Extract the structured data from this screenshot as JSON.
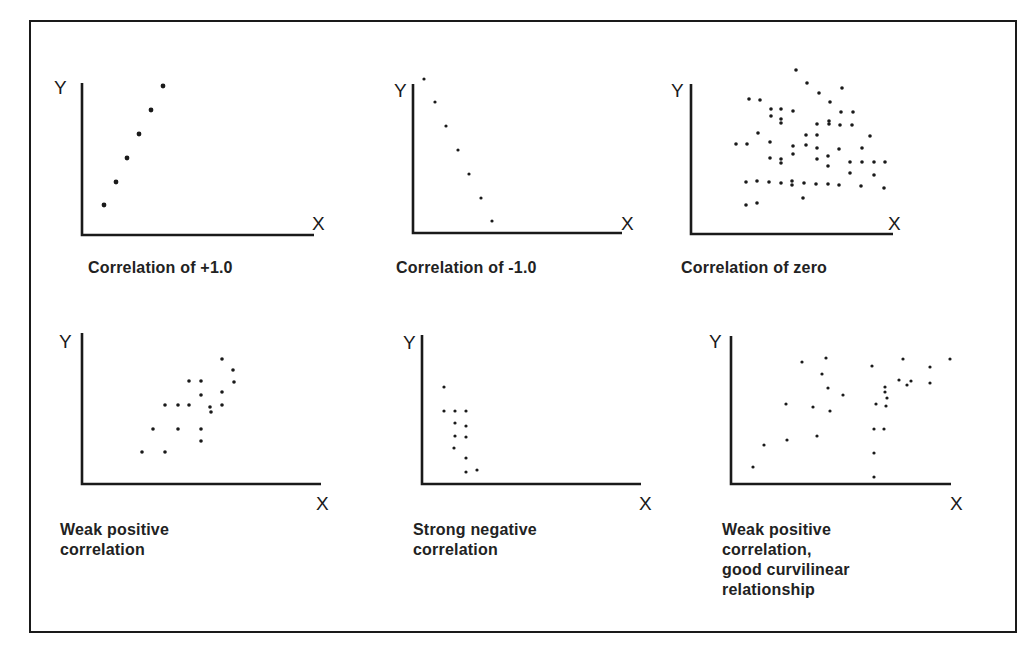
{
  "figure": {
    "border_color": "#1a1a1a",
    "ink_color": "#1a1a1a"
  },
  "chart_data": [
    {
      "type": "scatter",
      "title": "Correlation of +1.0",
      "xlabel": "X",
      "ylabel": "Y",
      "grid": false,
      "axes": {
        "origin": [
          82,
          235
        ],
        "y_top": 83,
        "x_end": 314
      },
      "label_pos": {
        "y": [
          54,
          78
        ],
        "x": [
          312,
          214
        ],
        "caption": [
          88,
          258
        ]
      },
      "points": [
        [
          104,
          205
        ],
        [
          116,
          182
        ],
        [
          127,
          158
        ],
        [
          139,
          134
        ],
        [
          151,
          110
        ],
        [
          163,
          86
        ]
      ]
    },
    {
      "type": "scatter",
      "title": "Correlation of -1.0",
      "xlabel": "X",
      "ylabel": "Y",
      "grid": false,
      "axes": {
        "origin": [
          413,
          233
        ],
        "y_top": 84,
        "x_end": 622
      },
      "label_pos": {
        "y": [
          394,
          81
        ],
        "x": [
          621,
          214
        ],
        "caption": [
          396,
          258
        ]
      },
      "points": [
        [
          424,
          79
        ],
        [
          435,
          102
        ],
        [
          446,
          126
        ],
        [
          458,
          150
        ],
        [
          469,
          174
        ],
        [
          481,
          198
        ],
        [
          492,
          221
        ]
      ]
    },
    {
      "type": "scatter",
      "title": "Correlation of zero",
      "xlabel": "X",
      "ylabel": "Y",
      "grid": false,
      "axes": {
        "origin": [
          691,
          234
        ],
        "y_top": 84,
        "x_end": 893
      },
      "label_pos": {
        "y": [
          671,
          81
        ],
        "x": [
          888,
          214
        ],
        "caption": [
          681,
          258
        ]
      },
      "points": [
        [
          796,
          70
        ],
        [
          807,
          83
        ],
        [
          819,
          93
        ],
        [
          842,
          88
        ],
        [
          830,
          102
        ],
        [
          749,
          99
        ],
        [
          760,
          100
        ],
        [
          771,
          109
        ],
        [
          781,
          109
        ],
        [
          771,
          116
        ],
        [
          793,
          111
        ],
        [
          781,
          123
        ],
        [
          781,
          119
        ],
        [
          841,
          112
        ],
        [
          853,
          112
        ],
        [
          817,
          124
        ],
        [
          829,
          121
        ],
        [
          829,
          124
        ],
        [
          840,
          125
        ],
        [
          852,
          125
        ],
        [
          758,
          133
        ],
        [
          870,
          136
        ],
        [
          806,
          135
        ],
        [
          817,
          135
        ],
        [
          736,
          144
        ],
        [
          747,
          144
        ],
        [
          770,
          142
        ],
        [
          793,
          146
        ],
        [
          806,
          145
        ],
        [
          817,
          148
        ],
        [
          839,
          149
        ],
        [
          862,
          148
        ],
        [
          793,
          154
        ],
        [
          817,
          159
        ],
        [
          828,
          156
        ],
        [
          770,
          158
        ],
        [
          781,
          159
        ],
        [
          781,
          163
        ],
        [
          828,
          166
        ],
        [
          850,
          162
        ],
        [
          862,
          162
        ],
        [
          874,
          162
        ],
        [
          885,
          162
        ],
        [
          850,
          173
        ],
        [
          874,
          175
        ],
        [
          746,
          182
        ],
        [
          757,
          181
        ],
        [
          769,
          182
        ],
        [
          781,
          183
        ],
        [
          792,
          181
        ],
        [
          792,
          185
        ],
        [
          804,
          183
        ],
        [
          816,
          184
        ],
        [
          828,
          184
        ],
        [
          839,
          185
        ],
        [
          861,
          186
        ],
        [
          884,
          188
        ],
        [
          803,
          198
        ],
        [
          746,
          205
        ],
        [
          757,
          203
        ]
      ]
    },
    {
      "type": "scatter",
      "title": "Weak positive\ncorrelation",
      "xlabel": "X",
      "ylabel": "Y",
      "grid": false,
      "axes": {
        "origin": [
          82,
          484
        ],
        "y_top": 333,
        "x_end": 321
      },
      "label_pos": {
        "y": [
          59,
          332
        ],
        "x": [
          316,
          494
        ],
        "caption": [
          60,
          520
        ]
      },
      "points": [
        [
          142,
          452
        ],
        [
          165,
          452
        ],
        [
          153,
          429
        ],
        [
          178,
          429
        ],
        [
          201,
          429
        ],
        [
          201,
          441
        ],
        [
          165,
          405
        ],
        [
          178,
          405
        ],
        [
          189,
          405
        ],
        [
          201,
          395
        ],
        [
          210,
          407
        ],
        [
          211,
          412
        ],
        [
          222,
          392
        ],
        [
          222,
          405
        ],
        [
          189,
          381
        ],
        [
          201,
          381
        ],
        [
          222,
          359
        ],
        [
          233,
          370
        ],
        [
          234,
          382
        ]
      ]
    },
    {
      "type": "scatter",
      "title": "Strong negative\ncorrelation",
      "xlabel": "X",
      "ylabel": "Y",
      "grid": false,
      "axes": {
        "origin": [
          422,
          484
        ],
        "y_top": 335,
        "x_end": 641
      },
      "label_pos": {
        "y": [
          403,
          333
        ],
        "x": [
          639,
          494
        ],
        "caption": [
          413,
          520
        ]
      },
      "points": [
        [
          444,
          387
        ],
        [
          444,
          411
        ],
        [
          455,
          411
        ],
        [
          466,
          411
        ],
        [
          455,
          423
        ],
        [
          466,
          426
        ],
        [
          455,
          436
        ],
        [
          466,
          437
        ],
        [
          454,
          448
        ],
        [
          466,
          458
        ],
        [
          466,
          472
        ],
        [
          477,
          470
        ]
      ]
    },
    {
      "type": "scatter",
      "title": "Weak positive\ncorrelation,\ngood curvilinear\nrelationship",
      "xlabel": "X",
      "ylabel": "Y",
      "grid": false,
      "axes": {
        "origin": [
          731,
          484
        ],
        "y_top": 336,
        "x_end": 951
      },
      "label_pos": {
        "y": [
          709,
          332
        ],
        "x": [
          950,
          494
        ],
        "caption": [
          722,
          520
        ]
      },
      "points": [
        [
          753,
          467
        ],
        [
          764,
          445
        ],
        [
          787,
          440
        ],
        [
          786,
          404
        ],
        [
          802,
          362
        ],
        [
          813,
          407
        ],
        [
          817,
          436
        ],
        [
          826,
          358
        ],
        [
          822,
          374
        ],
        [
          828,
          388
        ],
        [
          830,
          411
        ],
        [
          843,
          395
        ],
        [
          872,
          366
        ],
        [
          874,
          453
        ],
        [
          874,
          429
        ],
        [
          874,
          477
        ],
        [
          876,
          404
        ],
        [
          884,
          429
        ],
        [
          886,
          406
        ],
        [
          885,
          387
        ],
        [
          885,
          392
        ],
        [
          887,
          398
        ],
        [
          899,
          380
        ],
        [
          903,
          359
        ],
        [
          907,
          385
        ],
        [
          911,
          381
        ],
        [
          930,
          367
        ],
        [
          930,
          383
        ],
        [
          950,
          359
        ]
      ]
    }
  ],
  "panels": [
    {
      "caption": "Correlation  of +1.0",
      "y_label": "Y",
      "x_label": "X"
    },
    {
      "caption": "Correlation of -1.0",
      "y_label": "Y",
      "x_label": "X"
    },
    {
      "caption": "Correlation of zero",
      "y_label": "Y",
      "x_label": "X"
    },
    {
      "caption": "Weak positive\ncorrelation",
      "y_label": "Y",
      "x_label": "X"
    },
    {
      "caption": "Strong negative\ncorrelation",
      "y_label": "Y",
      "x_label": "X"
    },
    {
      "caption": "Weak positive\ncorrelation,\ngood curvilinear\nrelationship",
      "y_label": "Y",
      "x_label": "X"
    }
  ]
}
